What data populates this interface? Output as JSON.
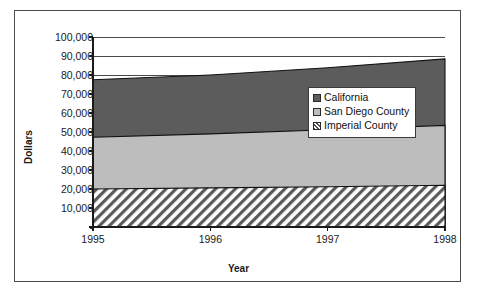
{
  "chart_data": {
    "type": "area",
    "stacked": true,
    "title": "",
    "subtitle": "",
    "xlabel": "Year",
    "ylabel": "Dollars",
    "x": [
      1995,
      1996,
      1997,
      1998
    ],
    "xtick_labels": [
      "1995",
      "1996",
      "1997",
      "1998"
    ],
    "ylim": [
      0,
      100000
    ],
    "ytick_values": [
      0,
      10000,
      20000,
      30000,
      40000,
      50000,
      60000,
      70000,
      80000,
      90000,
      100000
    ],
    "ytick_labels": [
      "-",
      "10,000",
      "20,000",
      "30,000",
      "40,000",
      "50,000",
      "60,000",
      "70,000",
      "80,000",
      "90,000",
      "100,000"
    ],
    "grid": true,
    "legend_position": "inside-right",
    "series": [
      {
        "name": "Imperial County",
        "swatch": "hatch-diagonal",
        "color": "#ffffff",
        "values": [
          20000,
          20600,
          21200,
          22000
        ],
        "cumulative": [
          20000,
          20600,
          21200,
          22000
        ]
      },
      {
        "name": "San Diego County",
        "swatch": "solid-light-gray",
        "color": "#bdbdbd",
        "values": [
          27200,
          28400,
          30000,
          31500
        ],
        "cumulative": [
          47200,
          49000,
          51200,
          53500
        ]
      },
      {
        "name": "California",
        "swatch": "solid-dark-gray",
        "color": "#5c5c5c",
        "values": [
          30300,
          31000,
          32600,
          35000
        ],
        "cumulative": [
          77500,
          80000,
          83800,
          88500
        ]
      }
    ],
    "legend": [
      {
        "label": "California",
        "swatch": "solid-dark-gray"
      },
      {
        "label": "San Diego County",
        "swatch": "solid-light-gray"
      },
      {
        "label": "Imperial County",
        "swatch": "hatch-diagonal"
      }
    ]
  },
  "colors": {
    "california": "#5c5c5c",
    "san_diego": "#bdbdbd",
    "imperial_hatch": "#555555",
    "axis": "#1a1a1a",
    "grid": "#4a4a4a",
    "frame": "#4a4a4a",
    "background": "#ffffff"
  }
}
